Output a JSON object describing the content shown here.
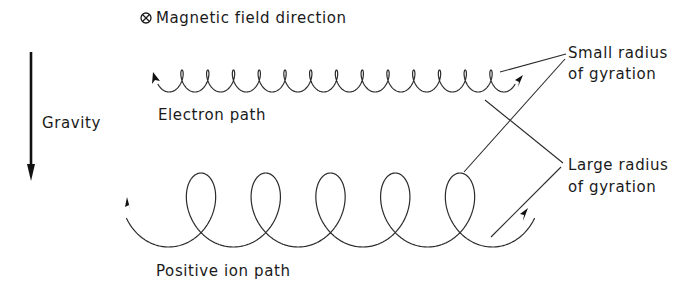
{
  "legend": {
    "symbol": "⊗",
    "text": "Magnetic field direction"
  },
  "gravity": {
    "label": "Gravity",
    "direction": "down"
  },
  "electron": {
    "label": "Electron path",
    "loop_count": 13,
    "annotation": "Small radius of gyration"
  },
  "ion": {
    "label": "Positive ion path",
    "loop_count": 5,
    "annotation": "Large radius of gyration"
  },
  "annotations": {
    "small_line1": "Small radius",
    "small_line2": "of gyration",
    "large_line1": "Large radius",
    "large_line2": "of gyration"
  },
  "colors": {
    "ink": "#2a2a2a",
    "background": "#ffffff"
  }
}
